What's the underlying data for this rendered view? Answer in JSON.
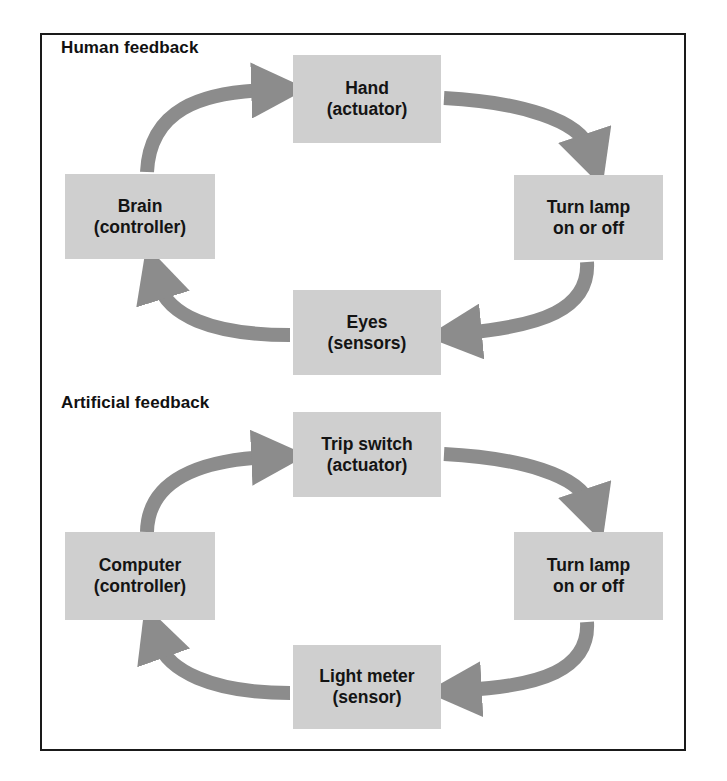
{
  "colors": {
    "box_fill": "#cfcfcf",
    "arrow": "#8c8c8c",
    "frame": "#1a1a1a",
    "text": "#141414"
  },
  "human": {
    "title": "Human feedback",
    "nodes": {
      "actuator": {
        "line1": "Hand",
        "line2": "(actuator)"
      },
      "controller": {
        "line1": "Brain",
        "line2": "(controller)"
      },
      "process": {
        "line1": "Turn lamp",
        "line2": "on or off"
      },
      "sensor": {
        "line1": "Eyes",
        "line2": "(sensors)"
      }
    }
  },
  "artificial": {
    "title": "Artificial feedback",
    "nodes": {
      "actuator": {
        "line1": "Trip switch",
        "line2": "(actuator)"
      },
      "controller": {
        "line1": "Computer",
        "line2": "(controller)"
      },
      "process": {
        "line1": "Turn lamp",
        "line2": "on or off"
      },
      "sensor": {
        "line1": "Light meter",
        "line2": "(sensor)"
      }
    }
  },
  "flow": [
    "controller",
    "actuator",
    "process",
    "sensor",
    "controller"
  ]
}
